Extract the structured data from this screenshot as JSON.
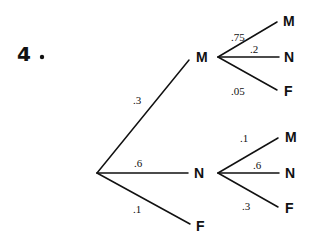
{
  "problem": {
    "number": "4",
    "dot": "."
  },
  "tree": {
    "root": {
      "x": 97,
      "y": 173
    },
    "level1": [
      {
        "label": "M",
        "prob": ".3",
        "lx1": 97,
        "ly1": 173,
        "lx2": 189,
        "ly2": 60,
        "tx": 196,
        "ty": 62,
        "px": 133,
        "py": 104
      },
      {
        "label": "N",
        "prob": ".6",
        "lx1": 97,
        "ly1": 173,
        "lx2": 188,
        "ly2": 173,
        "tx": 194,
        "ty": 178,
        "px": 134,
        "py": 167
      },
      {
        "label": "F",
        "prob": ".1",
        "lx1": 97,
        "ly1": 173,
        "lx2": 190,
        "ly2": 224,
        "tx": 196,
        "ty": 231,
        "px": 133,
        "py": 213
      }
    ],
    "level2_from_M": [
      {
        "label": "M",
        "prob": ".75",
        "tx": 283,
        "ty": 26,
        "px": 231,
        "py": 41
      },
      {
        "label": "N",
        "prob": ".2",
        "tx": 284,
        "ty": 62,
        "px": 250,
        "py": 53
      },
      {
        "label": "F",
        "prob": ".05",
        "tx": 284,
        "ty": 96,
        "px": 231,
        "py": 95
      }
    ],
    "level2_from_N": [
      {
        "label": "M",
        "prob": ".1",
        "tx": 285,
        "ty": 142,
        "px": 240,
        "py": 142
      },
      {
        "label": "N",
        "prob": ".6",
        "tx": 285,
        "ty": 178,
        "px": 253,
        "py": 169
      },
      {
        "label": "F",
        "prob": ".3",
        "tx": 285,
        "ty": 213,
        "px": 242,
        "py": 210
      }
    ]
  }
}
